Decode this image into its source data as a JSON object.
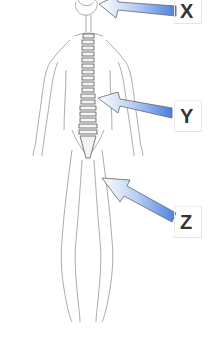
{
  "diagram": {
    "labels": [
      {
        "id": "X",
        "text": "X",
        "points_to": "brain"
      },
      {
        "id": "Y",
        "text": "Y",
        "points_to": "spinal cord"
      },
      {
        "id": "Z",
        "text": "Z",
        "points_to": "peripheral nerve"
      }
    ],
    "colors": {
      "arrow_fill": "#4a7fe0",
      "arrow_light": "#ffffff",
      "line": "#777777",
      "label": "#333333"
    }
  }
}
